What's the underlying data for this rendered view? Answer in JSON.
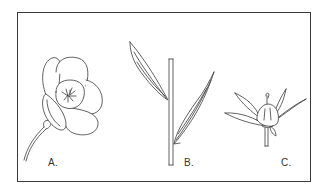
{
  "figure": {
    "panels": [
      {
        "id": "A",
        "label": "A.",
        "subject": "open flower with stem"
      },
      {
        "id": "B",
        "label": "B.",
        "subject": "stem with two lanceolate leaves"
      },
      {
        "id": "C",
        "label": "C.",
        "subject": "flower bud with sepals"
      }
    ]
  },
  "colors": {
    "line": "#3a3a3a",
    "background": "#ffffff",
    "border": "#3a3a3a"
  }
}
